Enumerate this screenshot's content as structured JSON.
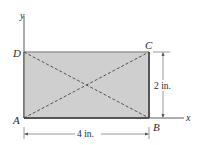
{
  "figure": {
    "axes": {
      "y_label": "y",
      "x_label": "x"
    },
    "points": {
      "A": "A",
      "B": "B",
      "C": "C",
      "D": "D"
    },
    "dimensions": {
      "width": "4 in.",
      "height": "2 in."
    },
    "colors": {
      "fill": "#cfcfcf",
      "edge": "#555555",
      "line": "#333333"
    }
  }
}
